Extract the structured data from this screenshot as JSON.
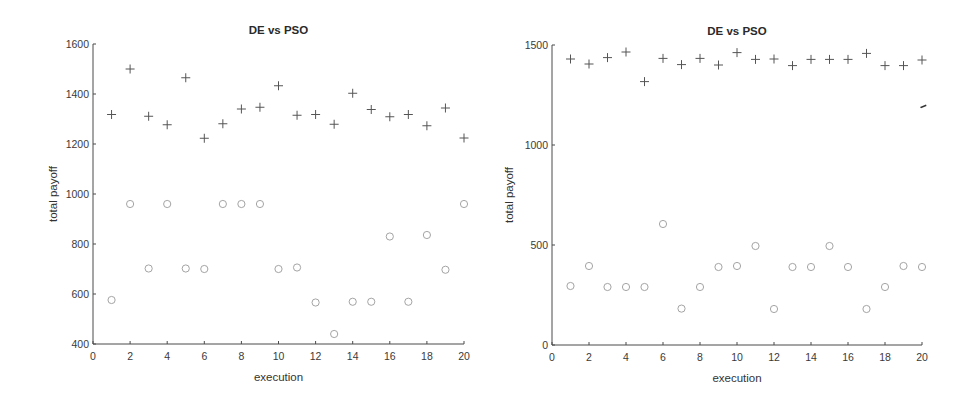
{
  "chart_data": [
    {
      "type": "scatter",
      "title": "DE vs PSO",
      "xlabel": "execution",
      "ylabel": "total payoff",
      "xlim": [
        0,
        20
      ],
      "ylim": [
        400,
        1600
      ],
      "xticks": [
        0,
        2,
        4,
        6,
        8,
        10,
        12,
        14,
        16,
        18,
        20
      ],
      "yticks": [
        400,
        600,
        800,
        1000,
        1200,
        1400,
        1600
      ],
      "grid": false,
      "legend": null,
      "x": [
        1,
        2,
        3,
        4,
        5,
        6,
        7,
        8,
        9,
        10,
        11,
        12,
        13,
        14,
        15,
        16,
        17,
        18,
        19,
        20
      ],
      "series": [
        {
          "name": "plus-marker series",
          "marker": "+",
          "color": "#555555",
          "values": [
            1318,
            1500,
            1311,
            1277,
            1465,
            1223,
            1281,
            1340,
            1347,
            1433,
            1315,
            1318,
            1279,
            1403,
            1338,
            1309,
            1318,
            1273,
            1344,
            1224
          ]
        },
        {
          "name": "circle-marker series",
          "marker": "o",
          "color": "#9a9a9a",
          "values": [
            576,
            960,
            702,
            960,
            702,
            700,
            960,
            960,
            960,
            700,
            706,
            566,
            440,
            569,
            569,
            830,
            569,
            836,
            697,
            960
          ]
        }
      ]
    },
    {
      "type": "scatter",
      "title": "DE vs PSO",
      "xlabel": "execution",
      "ylabel": "total payoff",
      "xlim": [
        0,
        20
      ],
      "ylim": [
        0,
        1500
      ],
      "xticks": [
        0,
        2,
        4,
        6,
        8,
        10,
        12,
        14,
        16,
        18,
        20
      ],
      "yticks": [
        0,
        500,
        1000,
        1500
      ],
      "grid": false,
      "legend": null,
      "x": [
        1,
        2,
        3,
        4,
        5,
        6,
        7,
        8,
        9,
        10,
        11,
        12,
        13,
        14,
        15,
        16,
        17,
        18,
        19,
        20
      ],
      "series": [
        {
          "name": "plus-marker series",
          "marker": "+",
          "color": "#555555",
          "values": [
            1430,
            1405,
            1437,
            1465,
            1317,
            1433,
            1402,
            1433,
            1400,
            1462,
            1428,
            1430,
            1397,
            1428,
            1428,
            1428,
            1458,
            1397,
            1397,
            1425
          ]
        },
        {
          "name": "circle-marker series",
          "marker": "o",
          "color": "#9a9a9a",
          "values": [
            295,
            395,
            290,
            290,
            290,
            605,
            182,
            290,
            390,
            395,
            495,
            180,
            390,
            390,
            495,
            390,
            180,
            290,
            395,
            390
          ]
        }
      ]
    }
  ],
  "layout": {
    "panels": [
      {
        "left": 93,
        "right": 464,
        "top": 44,
        "bottom": 344,
        "title_y": 30,
        "xlabel_y": 381,
        "ylabel_x": 57,
        "ylabel_y": 194
      },
      {
        "left": 552,
        "right": 922,
        "top": 45,
        "bottom": 345,
        "title_y": 31,
        "xlabel_y": 382,
        "ylabel_x": 513,
        "ylabel_y": 195
      }
    ]
  }
}
